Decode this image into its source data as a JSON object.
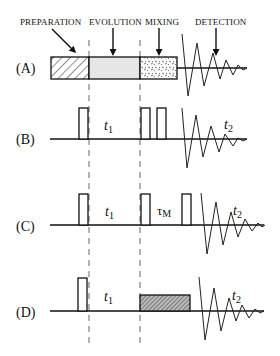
{
  "figure": {
    "phase_labels": {
      "preparation": "PREPARATION",
      "evolution": "EVOLUTION",
      "mixing": "MIXING",
      "detection": "DETECTION"
    },
    "rows": [
      {
        "id": "A",
        "label": "(A)",
        "description": "General 2D NMR scheme: preparation, evolution, mixing, detection blocks"
      },
      {
        "id": "B",
        "label": "(B)",
        "description": "Pulse - t1 - two pulses - FID",
        "t1": "t",
        "t1_sub": "1",
        "t2": "t",
        "t2_sub": "2"
      },
      {
        "id": "C",
        "label": "(C)",
        "description": "Pulse - t1 - pulse - tauM - pulse - FID",
        "t1": "t",
        "t1_sub": "1",
        "mixing": "τ",
        "mixing_sub": "M",
        "t2": "t",
        "t2_sub": "2"
      },
      {
        "id": "D",
        "label": "(D)",
        "description": "Pulse - t1 - spin-lock block - FID",
        "t1": "t",
        "t1_sub": "1",
        "t2": "t",
        "t2_sub": "2"
      }
    ],
    "colors": {
      "ink": "#111111",
      "evolution_fill": "#e6e6e6",
      "background": "#ffffff"
    }
  }
}
